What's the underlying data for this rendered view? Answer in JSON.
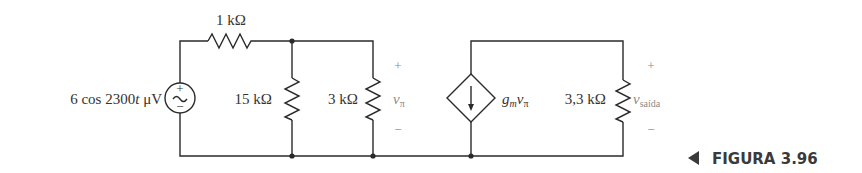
{
  "figure": {
    "caption": "FIGURA 3.96",
    "caption_marker": "◀"
  },
  "source": {
    "label": "6 cos 2300",
    "label_var": "t",
    "label_unit": " μV",
    "plus": "+",
    "minus": "−",
    "symbol": "~"
  },
  "resistors": {
    "r_series": "1 kΩ",
    "r_15k": "15 kΩ",
    "r_3k": "3 kΩ",
    "r_load": "3,3 kΩ"
  },
  "v_pi": {
    "symbol": "v",
    "subscript": "π",
    "plus": "+",
    "minus": "−"
  },
  "dependent_source": {
    "g": "g",
    "g_sub": "m",
    "v": "v",
    "v_sub": "π"
  },
  "v_out": {
    "symbol": "v",
    "subscript": "saída",
    "plus": "+",
    "minus": "−"
  }
}
